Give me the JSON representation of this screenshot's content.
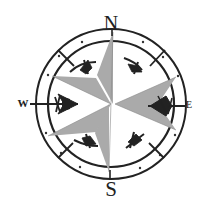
{
  "figure": {
    "type": "compass-rose",
    "colors": {
      "ink": "#222222",
      "star_fill": "#aaaaaa",
      "background": "#ffffff"
    },
    "labels": {
      "north": "N",
      "south": "S",
      "west": "W",
      "east": "E"
    }
  }
}
